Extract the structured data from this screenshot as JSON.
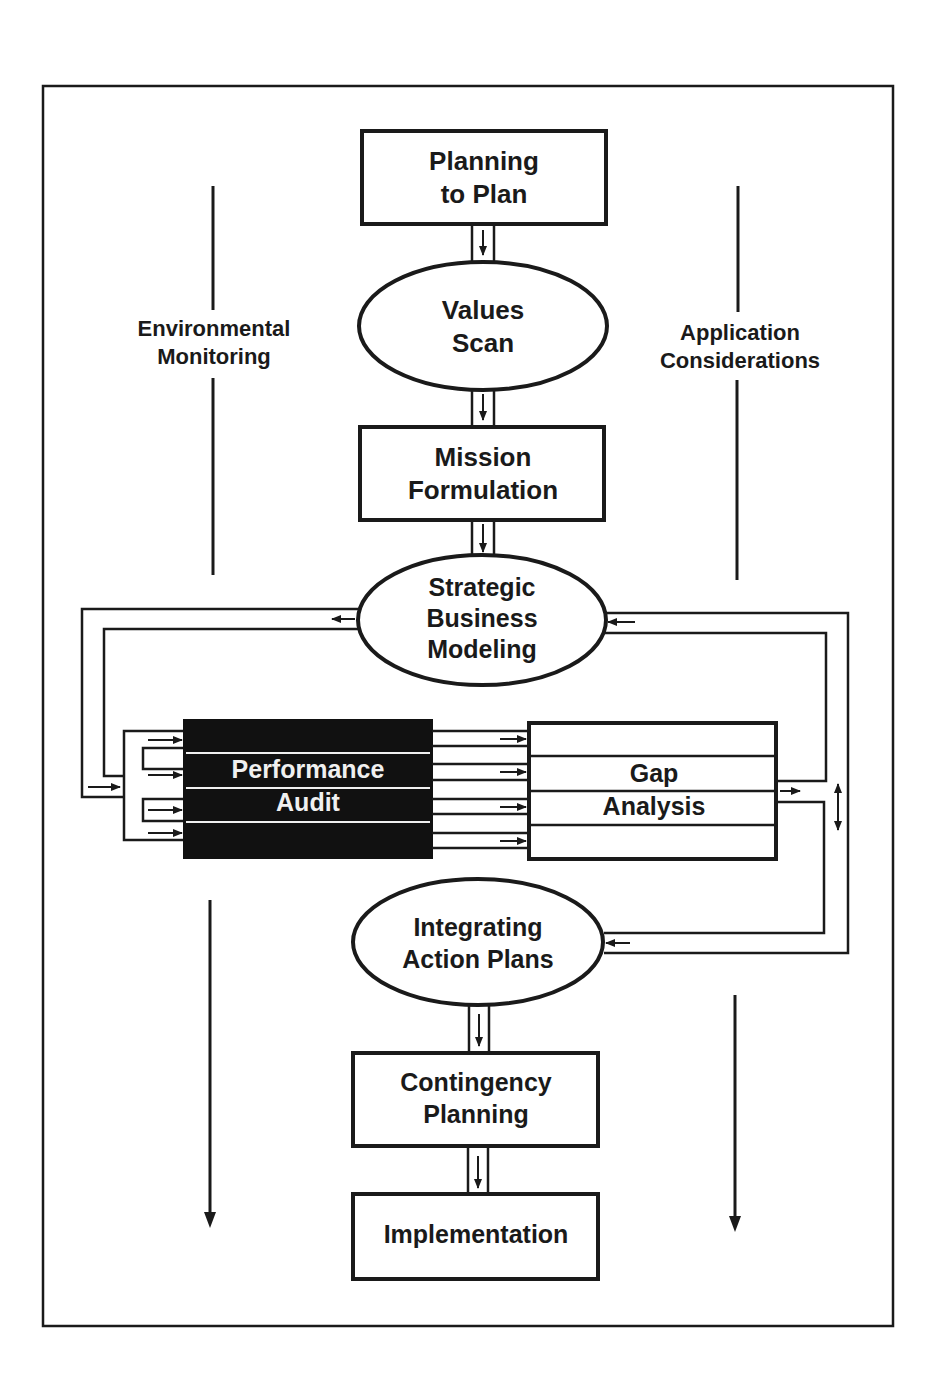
{
  "diagram": {
    "colors": {
      "ink": "#1a1a1a",
      "paper": "#ffffff",
      "inverse_fill": "#111111",
      "inverse_text": "#f0f0f0"
    },
    "side_labels": {
      "left": {
        "line1": "Environmental",
        "line2": "Monitoring"
      },
      "right": {
        "line1": "Application",
        "line2": "Considerations"
      }
    },
    "nodes": {
      "planning_to_plan": {
        "shape": "box",
        "line1": "Planning",
        "line2": "to Plan"
      },
      "values_scan": {
        "shape": "ellipse",
        "line1": "Values",
        "line2": "Scan"
      },
      "mission_formulation": {
        "shape": "box",
        "line1": "Mission",
        "line2": "Formulation"
      },
      "strategic_business_modeling": {
        "shape": "ellipse",
        "line1": "Strategic",
        "line2": "Business",
        "line3": "Modeling"
      },
      "performance_audit": {
        "shape": "inverse-box",
        "line1": "Performance",
        "line2": "Audit"
      },
      "gap_analysis": {
        "shape": "box",
        "line1": "Gap",
        "line2": "Analysis"
      },
      "integrating_action_plans": {
        "shape": "ellipse",
        "line1": "Integrating",
        "line2": "Action Plans"
      },
      "contingency_planning": {
        "shape": "box",
        "line1": "Contingency",
        "line2": "Planning"
      },
      "implementation": {
        "shape": "box",
        "line1": "Implementation"
      }
    },
    "edges": [
      {
        "from": "planning_to_plan",
        "to": "values_scan"
      },
      {
        "from": "values_scan",
        "to": "mission_formulation"
      },
      {
        "from": "mission_formulation",
        "to": "strategic_business_modeling"
      },
      {
        "from": "strategic_business_modeling",
        "to": "performance_audit"
      },
      {
        "from": "performance_audit",
        "to": "gap_analysis"
      },
      {
        "from": "gap_analysis",
        "to": "strategic_business_modeling"
      },
      {
        "from": "gap_analysis",
        "to": "integrating_action_plans"
      },
      {
        "from": "integrating_action_plans",
        "to": "contingency_planning"
      },
      {
        "from": "contingency_planning",
        "to": "implementation"
      }
    ]
  }
}
